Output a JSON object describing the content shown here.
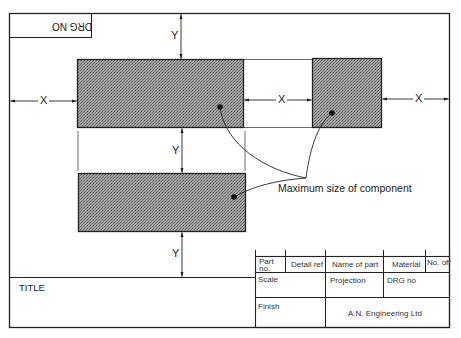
{
  "drawing": {
    "drg_no_box_label": "DRG NO",
    "drg_no_orientation": "rotated 180°",
    "dimensions": {
      "x_label": "X",
      "y_label": "Y"
    },
    "annotation": "Maximum size of component",
    "components": [
      {
        "id": "component-top-left",
        "fill": "#8c8c8c"
      },
      {
        "id": "component-top-right",
        "fill": "#8c8c8c"
      },
      {
        "id": "component-bottom",
        "fill": "#8c8c8c"
      }
    ]
  },
  "title_block": {
    "title_label": "TITLE",
    "row1": {
      "part_no": "Part no.",
      "detail_ref": "Detail ref",
      "name_of_part": "Name of part",
      "material": "Material",
      "no_off": "No. off"
    },
    "row2": {
      "scale": "Scale",
      "projection": "Projection",
      "drg_no": "DRG no"
    },
    "row3": {
      "finish": "Finish",
      "company": "A.N. Engineering Ltd"
    }
  },
  "colors": {
    "line": "#222222",
    "component_fill": "#8c8c8c",
    "background": "#ffffff"
  }
}
